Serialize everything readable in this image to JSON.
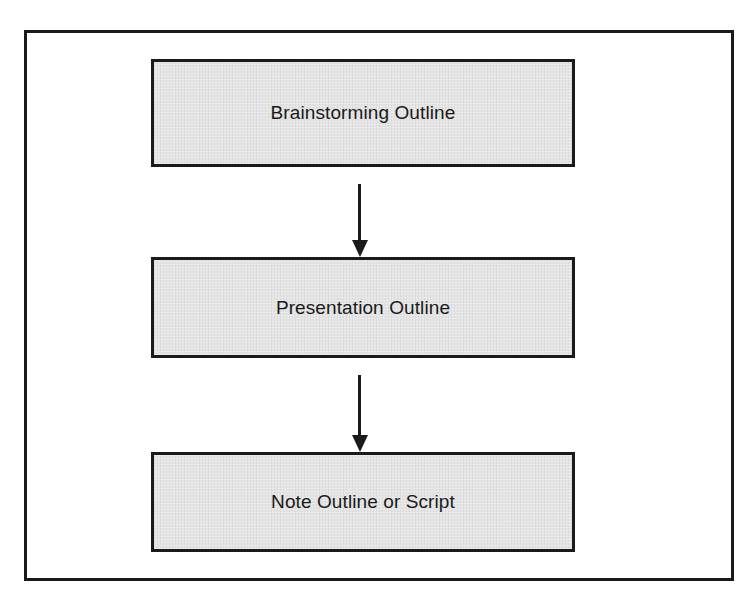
{
  "diagram": {
    "type": "flowchart",
    "direction": "top-to-bottom",
    "nodes": [
      {
        "id": "brainstorming",
        "label": "Brainstorming Outline"
      },
      {
        "id": "presentation",
        "label": "Presentation Outline"
      },
      {
        "id": "note",
        "label": "Note Outline or Script"
      }
    ],
    "edges": [
      {
        "from": "brainstorming",
        "to": "presentation"
      },
      {
        "from": "presentation",
        "to": "note"
      }
    ],
    "colors": {
      "border": "#1a1a1a",
      "box_fill": "#e4e4e4",
      "background": "#ffffff"
    }
  }
}
